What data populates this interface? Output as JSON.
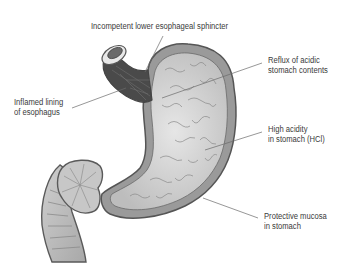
{
  "diagram": {
    "labels": {
      "sphincter": "Incompetent lower esophageal sphincter",
      "reflux_line1": "Reflux of acidic",
      "reflux_line2": "stomach contents",
      "inflamed_line1": "Inflamed lining",
      "inflamed_line2": "of esophagus",
      "acidity_line1": "High acidity",
      "acidity_line2": "in stomach (HCl)",
      "mucosa_line1": "Protective mucosa",
      "mucosa_line2": "in stomach"
    },
    "colors": {
      "outline": "#5a5a5a",
      "wall": "#9a9a9a",
      "interior": "#d4d4d4",
      "inflamed": "#3c3c3c",
      "text": "#3a3a3a",
      "leader": "#6a6a6a"
    }
  }
}
